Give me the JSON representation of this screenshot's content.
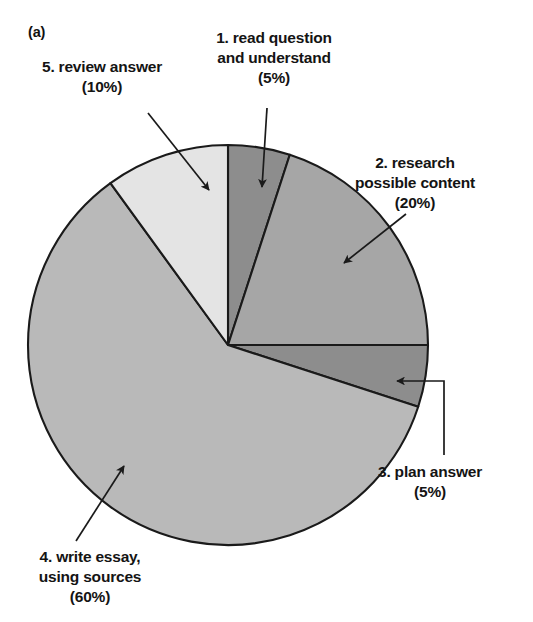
{
  "figure": {
    "panel_letter": "(a)",
    "background_color": "#ffffff",
    "outline_color": "#1a1a1a"
  },
  "chart_data": {
    "type": "pie",
    "title": "",
    "subtitle": "",
    "xlabel": "",
    "ylabel": "",
    "grid": false,
    "legend_position": "none",
    "label_style": "external-labels-with-leader-lines",
    "units": "percent",
    "total": 100,
    "start_angle_deg": 0,
    "direction": "clockwise",
    "center_px": [
      228,
      345
    ],
    "radius_px": 200,
    "categories": [
      "1. read question and understand",
      "2. research possible content",
      "3. plan answer",
      "4. write essay, using sources",
      "5. review answer"
    ],
    "values": [
      5,
      20,
      5,
      60,
      10
    ],
    "slices": [
      {
        "index": 1,
        "label_line1": "1. read question",
        "label_line2": "and understand",
        "label_value": "(5%)",
        "value": 5,
        "start_deg": 0,
        "end_deg": 18,
        "color": "#8d8d8d"
      },
      {
        "index": 2,
        "label_line1": "2. research",
        "label_line2": "possible content",
        "label_value": "(20%)",
        "value": 20,
        "start_deg": 18,
        "end_deg": 90,
        "color": "#a6a6a6"
      },
      {
        "index": 3,
        "label_line1": "3. plan answer",
        "label_line2": "",
        "label_value": "(5%)",
        "value": 5,
        "start_deg": 90,
        "end_deg": 108,
        "color": "#8d8d8d"
      },
      {
        "index": 4,
        "label_line1": "4. write essay,",
        "label_line2": "using sources",
        "label_value": "(60%)",
        "value": 60,
        "start_deg": 108,
        "end_deg": 324,
        "color": "#b9b9b9"
      },
      {
        "index": 5,
        "label_line1": "5. review answer",
        "label_line2": "",
        "label_value": "(10%)",
        "value": 10,
        "start_deg": 324,
        "end_deg": 360,
        "color": "#e4e4e4"
      }
    ]
  },
  "labels": {
    "slice1": "1. read question\nand understand\n(5%)",
    "slice2": "2. research\npossible content\n(20%)",
    "slice3": "3. plan answer\n(5%)",
    "slice4": "4. write essay,\nusing sources\n(60%)",
    "slice5": "5. review answer\n(10%)"
  }
}
